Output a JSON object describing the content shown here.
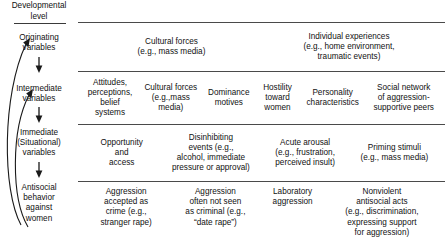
{
  "figure": {
    "header_label": "Developmental\nlevel",
    "header_line1": "Developmental",
    "header_line2": "level",
    "accent_color": "#3a3a3a",
    "background_color": "#ffffff",
    "text_color": "#111111"
  },
  "levels": [
    {
      "id": "originating",
      "label": "Originating\nvariables",
      "line1": "Originating",
      "line2": "variables",
      "line3": ""
    },
    {
      "id": "intermediate",
      "label": "Intermediate\nvariables",
      "line1": "Intermediate",
      "line2": "variables",
      "line3": ""
    },
    {
      "id": "immediate",
      "label": "Immediate\n(Situational)\nvariables",
      "line1": "Immediate",
      "line2": "(Situational)",
      "line3": "variables"
    },
    {
      "id": "antisocial",
      "label": "Antisocial\nbehavior\nagainst\nwomen",
      "line1": "Antisocial",
      "line2": "behavior",
      "line3": "against",
      "line4": "women"
    }
  ],
  "rows": [
    {
      "id": "originating-row",
      "cells": [
        {
          "line1": "Cultural forces",
          "line2": "(e.g., mass media)",
          "line3": "",
          "line4": "",
          "line5": ""
        },
        {
          "line1": "Individual experiences",
          "line2": "(e.g., home environment,",
          "line3": "traumatic events)",
          "line4": "",
          "line5": ""
        }
      ]
    },
    {
      "id": "intermediate-row",
      "cells": [
        {
          "line1": "Attitudes,",
          "line2": "perceptions,",
          "line3": "belief",
          "line4": "systems",
          "line5": ""
        },
        {
          "line1": "Cultural forces",
          "line2": "(e.g.,mass",
          "line3": "media)",
          "line4": "",
          "line5": ""
        },
        {
          "line1": "Dominance",
          "line2": "motives",
          "line3": "",
          "line4": "",
          "line5": ""
        },
        {
          "line1": "Hostility",
          "line2": "toward",
          "line3": "women",
          "line4": "",
          "line5": ""
        },
        {
          "line1": "Personality",
          "line2": "characteristics",
          "line3": "",
          "line4": "",
          "line5": ""
        },
        {
          "line1": "Social network",
          "line2": "of aggression-",
          "line3": "supportive peers",
          "line4": "",
          "line5": ""
        }
      ]
    },
    {
      "id": "immediate-row",
      "cells": [
        {
          "line1": "Opportunity",
          "line2": "and",
          "line3": "access",
          "line4": "",
          "line5": ""
        },
        {
          "line1": "Disinhibiting",
          "line2": "events (e.g.,",
          "line3": "alcohol, immediate",
          "line4": "pressure or approval)",
          "line5": ""
        },
        {
          "line1": "Acute arousal",
          "line2": "(e.g., frustration,",
          "line3": "perceived insult)",
          "line4": "",
          "line5": ""
        },
        {
          "line1": "Priming stimuli",
          "line2": "(e.g., mass media)",
          "line3": "",
          "line4": "",
          "line5": ""
        }
      ]
    },
    {
      "id": "antisocial-row",
      "cells": [
        {
          "line1": "Aggression",
          "line2": "accepted as",
          "line3": "crime (e.g.,",
          "line4": "stranger rape)",
          "line5": ""
        },
        {
          "line1": "Aggression",
          "line2": "often not seen",
          "line3": "as criminal (e.g.,",
          "line4": "“date rape”)",
          "line5": ""
        },
        {
          "line1": "Laboratory",
          "line2": "aggression",
          "line3": "",
          "line4": "",
          "line5": ""
        },
        {
          "line1": "Nonviolent",
          "line2": "antisocial acts",
          "line3": "(e.g., discrimination,",
          "line4": "expressing support",
          "line5": "for aggression)"
        }
      ]
    }
  ],
  "arrows": {
    "down_arrow_icon": "arrow-down-icon",
    "feedback_arrow_icon": "curved-feedback-arrow-icon",
    "feedback_count": 2
  }
}
